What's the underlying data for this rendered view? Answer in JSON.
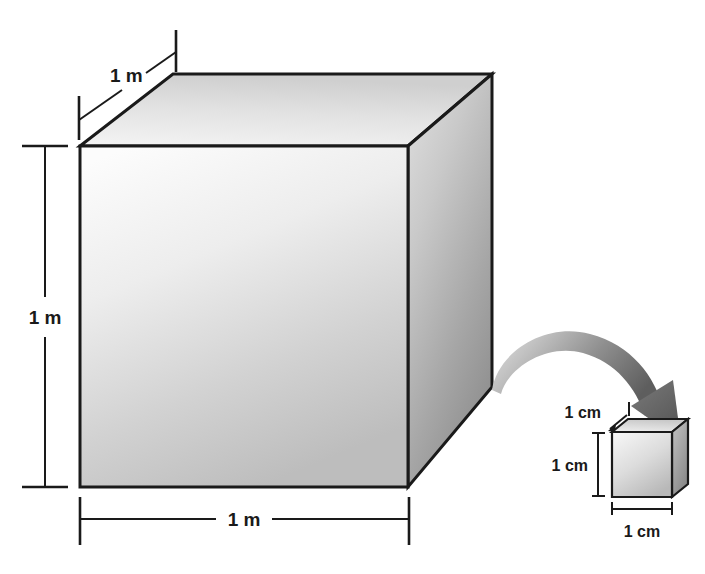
{
  "figure": {
    "background_color": "#ffffff",
    "line_color": "#1a1a1a"
  },
  "large_cube": {
    "name": "one-cubic-meter-cube",
    "front_face_fill_light": "#fafafa",
    "front_face_fill_dark": "#bdbdbd",
    "top_face_fill_light": "#f2f2f2",
    "top_face_fill_dark": "#cfcfcf",
    "right_face_fill_light": "#d8d8d8",
    "right_face_fill_dark": "#8e8e8e",
    "dimensions": {
      "depth_label": "1 m",
      "height_label": "1 m",
      "width_label": "1 m"
    }
  },
  "small_cube": {
    "name": "one-cubic-centimeter-cube",
    "front_face_fill_light": "#f4f4f4",
    "front_face_fill_dark": "#b8b8b8",
    "top_face_fill_light": "#ededed",
    "top_face_fill_dark": "#c9c9c9",
    "right_face_fill_light": "#bdbdbd",
    "right_face_fill_dark": "#8a8a8a",
    "dimensions": {
      "depth_label": "1 cm",
      "height_label": "1 cm",
      "width_label": "1 cm"
    }
  },
  "arrow": {
    "name": "zoom-callout-arrow",
    "color_start": "#d6d6d6",
    "color_end": "#5e5e5e",
    "description": "curved arrow from large cube corner to small cube"
  }
}
